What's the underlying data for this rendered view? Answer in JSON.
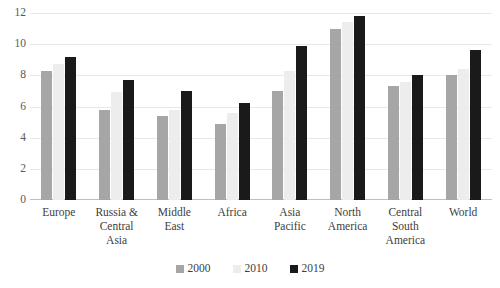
{
  "chart_data": {
    "type": "bar",
    "title": "",
    "subtitle": "",
    "xlabel": "",
    "ylabel": "",
    "ylim": [
      0,
      12
    ],
    "ytick_step": 2,
    "yticks": [
      "12",
      "10",
      "8",
      "6",
      "4",
      "2",
      "0"
    ],
    "grid": true,
    "legend_position": "bottom-center",
    "categories": [
      "Europe",
      "Russia & Central Asia",
      "Middle East",
      "Africa",
      "Asia Pacific",
      "North America",
      "Central South America",
      "World"
    ],
    "category_lines": [
      [
        "Europe"
      ],
      [
        "Russia &",
        "Central",
        "Asia"
      ],
      [
        "Middle",
        "East"
      ],
      [
        "Africa"
      ],
      [
        "Asia",
        "Pacific"
      ],
      [
        "North",
        "America"
      ],
      [
        "Central",
        "South",
        "America"
      ],
      [
        "World"
      ]
    ],
    "series": [
      {
        "name": "2000",
        "color": "#a6a6a6",
        "values": [
          8.3,
          5.8,
          5.4,
          4.9,
          7.0,
          11.0,
          7.3,
          8.0
        ]
      },
      {
        "name": "2010",
        "color": "#ededed",
        "values": [
          8.7,
          6.9,
          5.8,
          5.6,
          8.3,
          11.4,
          7.6,
          8.4
        ]
      },
      {
        "name": "2019",
        "color": "#1a1a1a",
        "values": [
          9.2,
          7.7,
          7.0,
          6.2,
          9.9,
          11.8,
          8.0,
          9.6
        ]
      }
    ]
  }
}
